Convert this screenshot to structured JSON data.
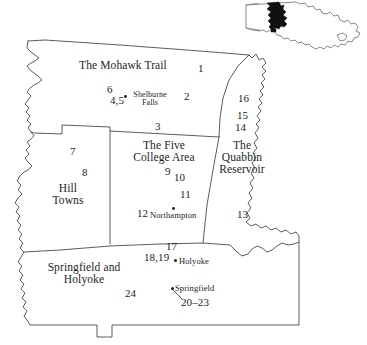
{
  "map": {
    "title": "Western Massachusetts regions",
    "background_color": "#ffffff",
    "line_color": "#4a4a4a",
    "text_color": "#1d1d1d",
    "inset": {
      "name": "massachusetts-state-inset",
      "highlight_color": "#111111",
      "outline_color": "#555555"
    },
    "regions": [
      {
        "id": "mohawk-trail",
        "label": "The Mohawk Trail"
      },
      {
        "id": "five-college-area",
        "label": "The Five\nCollege Area"
      },
      {
        "id": "quabbin-reservoir",
        "label": "The\nQuabbin\nReservoir"
      },
      {
        "id": "hill-towns",
        "label": "Hill\nTowns"
      },
      {
        "id": "springfield-and-holyoke",
        "label": "Springfield and\nHolyoke"
      }
    ],
    "cities": [
      {
        "id": "shelburne-falls",
        "label": "Shelburne\nFalls"
      },
      {
        "id": "northampton",
        "label": "Northampton"
      },
      {
        "id": "holyoke",
        "label": "Holyoke"
      },
      {
        "id": "springfield",
        "label": "Springfield"
      }
    ],
    "numbers": [
      {
        "id": "n1",
        "label": "1"
      },
      {
        "id": "n2",
        "label": "2"
      },
      {
        "id": "n3",
        "label": "3"
      },
      {
        "id": "n4-5",
        "label": "4,5"
      },
      {
        "id": "n6",
        "label": "6"
      },
      {
        "id": "n7",
        "label": "7"
      },
      {
        "id": "n8",
        "label": "8"
      },
      {
        "id": "n9",
        "label": "9"
      },
      {
        "id": "n10",
        "label": "10"
      },
      {
        "id": "n11",
        "label": "11"
      },
      {
        "id": "n12",
        "label": "12"
      },
      {
        "id": "n13",
        "label": "13"
      },
      {
        "id": "n14",
        "label": "14"
      },
      {
        "id": "n15",
        "label": "15"
      },
      {
        "id": "n16",
        "label": "16"
      },
      {
        "id": "n17",
        "label": "17"
      },
      {
        "id": "n18-19",
        "label": "18,19"
      },
      {
        "id": "n20-23",
        "label": "20–23"
      },
      {
        "id": "n24",
        "label": "24"
      }
    ]
  }
}
